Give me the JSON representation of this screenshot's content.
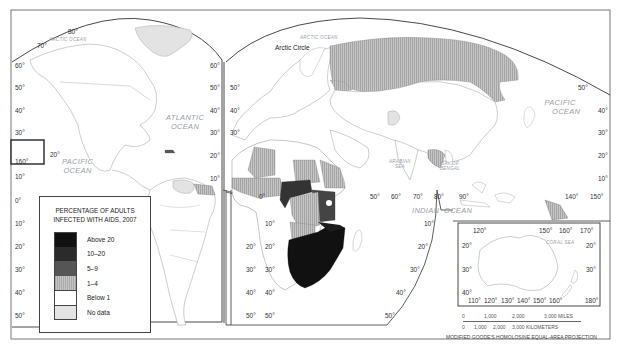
{
  "map": {
    "title": "Percentage of adults infected with AIDS, 2007",
    "projection": "MODIFIED GOODE'S HOMOLOSINE EQUAL-AREA PROJECTION",
    "colors": {
      "above_20": "#111111",
      "10_20": "#2b2b2b",
      "5_9": "#555555",
      "1_4": "#b4b4b4",
      "below_1": "#ffffff",
      "no_data": "#e3e3e3",
      "border": "#555555",
      "frame": "#444444"
    },
    "oceans": {
      "arctic_left": "ARCTIC OCEAN",
      "arctic_right": "ARCTIC OCEAN",
      "atlantic_1": "ATLANTIC",
      "atlantic_2": "OCEAN",
      "pacific_left_1": "PACIFIC",
      "pacific_left_2": "OCEAN",
      "pacific_right_1": "PACIFIC",
      "pacific_right_2": "OCEAN",
      "indian_1": "INDIAN",
      "indian_2": "OCEAN",
      "arabian_1": "ARABIAN",
      "arabian_2": "SEA",
      "bengal_1": "BAY OF",
      "bengal_2": "BENGAL",
      "coral_sea": "CORAL SEA"
    },
    "places": {
      "arctic_circle": "Arctic Circle"
    },
    "lat_labels_left": [
      "60°",
      "50°",
      "40°",
      "30°",
      "20°",
      "10°",
      "0°",
      "10°",
      "20°",
      "30°",
      "40°",
      "50°"
    ],
    "lat_labels_americas_right": [
      "60°",
      "50°",
      "40°",
      "30°",
      "20°",
      "10°"
    ],
    "lat_labels_europe": [
      "50°",
      "40°",
      "30°"
    ],
    "lat_labels_africa_left": [
      "20°",
      "30°",
      "40°",
      "50°"
    ],
    "lat_labels_africa_right": [
      "10°",
      "20°",
      "30°",
      "40°",
      "50°"
    ],
    "lat_labels_indian": [
      "10°",
      "20°",
      "30°",
      "40°",
      "50°"
    ],
    "lat_labels_pacific_right": [
      "50°",
      "40°",
      "30°",
      "20°",
      "10°"
    ],
    "lon_labels_top": [
      "80°",
      "70°"
    ],
    "lon_labels_inset_hawaii": [
      "160°",
      "20°"
    ],
    "lon_labels_equator": [
      "0°",
      "50°",
      "60°",
      "70°",
      "80°",
      "90°",
      "140°",
      "150°"
    ],
    "australia_inset": {
      "top_lon": [
        "120°",
        "150°",
        "160°",
        "170°"
      ],
      "bottom_lon": [
        "110°",
        "120°",
        "130°",
        "140°",
        "150°",
        "160°",
        "180°"
      ],
      "lat_left": [
        "20°",
        "30°",
        "40°"
      ],
      "lat_right": [
        "20°",
        "30°"
      ]
    },
    "scale_bar": {
      "miles": [
        "0",
        "1,000",
        "2,000",
        "3,000 MILES"
      ],
      "km": [
        "0",
        "1,000",
        "2,000",
        "3,000 KILOMETERS"
      ]
    }
  },
  "legend": {
    "title_line1": "PERCENTAGE OF ADULTS",
    "title_line2": "INFECTED WITH AIDS, 2007",
    "items": [
      {
        "label": "Above 20",
        "color": "#111111"
      },
      {
        "label": "10–20",
        "color": "#2b2b2b"
      },
      {
        "label": "5–9",
        "color": "#555555"
      },
      {
        "label": "1–4",
        "color": "#b4b4b4",
        "pattern": "stripes"
      },
      {
        "label": "Below 1",
        "color": "#ffffff"
      },
      {
        "label": "No data",
        "color": "#e3e3e3"
      }
    ]
  }
}
